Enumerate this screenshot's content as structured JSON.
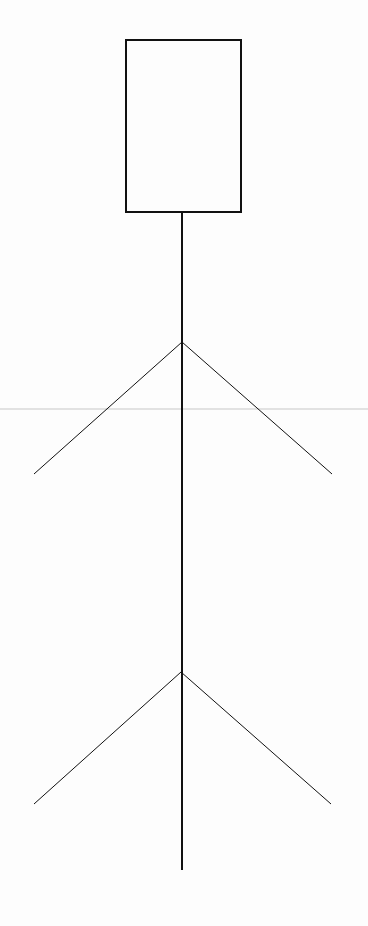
{
  "canvas": {
    "width": 368,
    "height": 926,
    "background": "#fdfdfd"
  },
  "diagram": {
    "type": "line-drawing",
    "stroke_color": "#111111",
    "guide_color": "#e2e2e2",
    "head_box": {
      "x": 126,
      "y": 40,
      "width": 115,
      "height": 172,
      "stroke_width": 2
    },
    "trunk": {
      "x": 182,
      "y1": 212,
      "y2": 870,
      "stroke_width": 2
    },
    "branches": [
      {
        "name": "upper",
        "apex": {
          "x": 182,
          "y": 342
        },
        "left_end": {
          "x": 34,
          "y": 474
        },
        "right_end": {
          "x": 332,
          "y": 474
        },
        "stroke_width": 1
      },
      {
        "name": "lower",
        "apex": {
          "x": 181,
          "y": 672
        },
        "left_end": {
          "x": 34,
          "y": 804
        },
        "right_end": {
          "x": 331,
          "y": 804
        },
        "stroke_width": 1
      }
    ],
    "guide_lines": [
      {
        "y": 409
      }
    ]
  }
}
